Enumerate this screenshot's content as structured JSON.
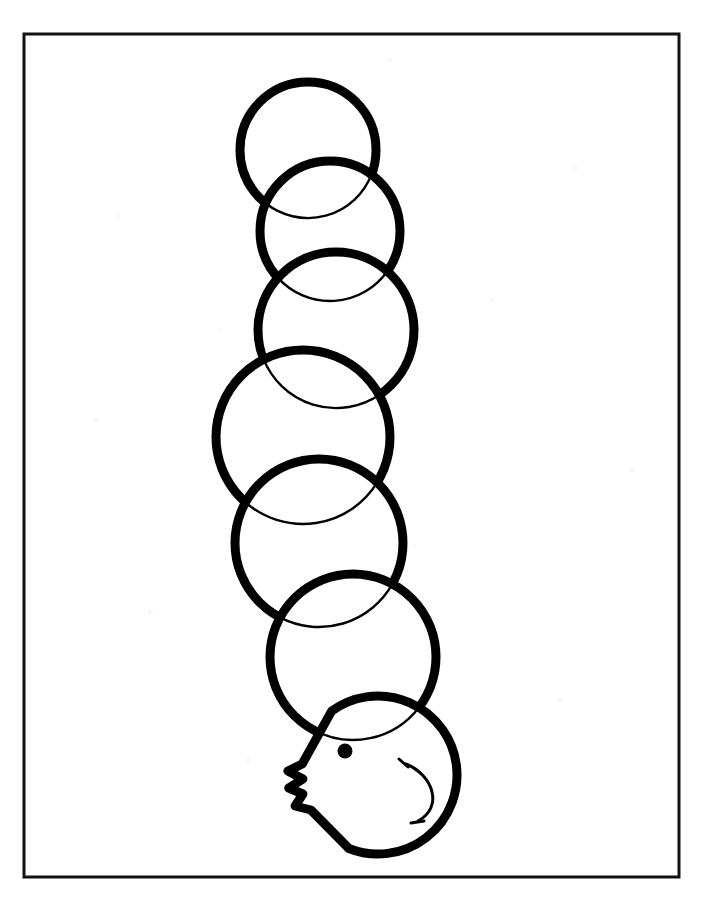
{
  "page": {
    "width": 703,
    "height": 898,
    "background_color": "#ffffff",
    "caption": ""
  },
  "frame": {
    "name": "page-border",
    "x": 24,
    "y": 34,
    "width": 655,
    "height": 843,
    "stroke_color": "#111111",
    "stroke_width": 3,
    "fill": "none"
  },
  "artwork": {
    "name": "caterpillar-line-drawing",
    "style": "black outline, white fill, coloring-book line art",
    "outline_color": "#000000",
    "fill_color": "#ffffff",
    "thick_stroke": 9,
    "thin_stroke": 2.4,
    "body_segment_count": 6,
    "segments": [
      {
        "name": "body-segment-1",
        "cx": 308,
        "cy": 150,
        "r": 68,
        "order": 1
      },
      {
        "name": "body-segment-2",
        "cx": 330,
        "cy": 231,
        "r": 70,
        "order": 2
      },
      {
        "name": "body-segment-3",
        "cx": 336,
        "cy": 330,
        "r": 78,
        "order": 3
      },
      {
        "name": "body-segment-4",
        "cx": 303,
        "cy": 437,
        "r": 87,
        "order": 4
      },
      {
        "name": "body-segment-5",
        "cx": 319,
        "cy": 543,
        "r": 84,
        "order": 5
      },
      {
        "name": "body-segment-6",
        "cx": 353,
        "cy": 657,
        "r": 83,
        "order": 6
      }
    ],
    "head": {
      "name": "caterpillar-head",
      "cx": 378,
      "cy": 775,
      "r": 79
    },
    "eye": {
      "name": "eye",
      "cx": 345,
      "cy": 751,
      "r": 7.5,
      "fill": "#000000"
    },
    "mouth": {
      "name": "smile",
      "description": "open C-curve facing left with small tick ends",
      "top_x": 406,
      "top_y": 764,
      "bottom_x": 418,
      "bottom_y": 821
    },
    "mandibles": {
      "name": "mandible-feelers",
      "description": "two pointed zigzag projections on the left of the head",
      "count": 2
    }
  }
}
